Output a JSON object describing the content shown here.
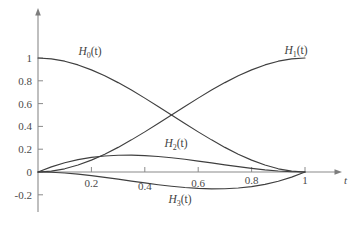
{
  "chart_data": {
    "type": "line",
    "title": "",
    "subtitle": "",
    "xlabel": "t",
    "ylabel": "",
    "xlim": [
      0,
      1.12
    ],
    "ylim": [
      -0.3,
      1.12
    ],
    "grid": false,
    "legend_position": "inline-labels",
    "x_ticks": [
      {
        "value": 0.2,
        "label": "0.2"
      },
      {
        "value": 0.4,
        "label": "0.4"
      },
      {
        "value": 0.6,
        "label": "0.6"
      },
      {
        "value": 0.8,
        "label": "0.8"
      },
      {
        "value": 1.0,
        "label": "1"
      }
    ],
    "y_ticks": [
      {
        "value": 1.0,
        "label": "1"
      },
      {
        "value": 0.8,
        "label": "0.8"
      },
      {
        "value": 0.6,
        "label": "0.6"
      },
      {
        "value": 0.4,
        "label": "0.4"
      },
      {
        "value": 0.2,
        "label": "0.2"
      },
      {
        "value": 0.0,
        "label": "0"
      },
      {
        "value": -0.2,
        "label": "-0.2"
      }
    ],
    "x": [
      0,
      0.05,
      0.1,
      0.15,
      0.2,
      0.25,
      0.3,
      0.35,
      0.4,
      0.45,
      0.5,
      0.55,
      0.6,
      0.65,
      0.7,
      0.75,
      0.8,
      0.85,
      0.9,
      0.95,
      1
    ],
    "series": [
      {
        "name": "H_0(t)",
        "label_base": "H",
        "label_sub": "0",
        "label_tail": "(t)",
        "formula": "2t^3 - 3t^2 + 1",
        "color": "#3f3f3f",
        "values": [
          1,
          0.9928,
          0.972,
          0.9393,
          0.896,
          0.8438,
          0.784,
          0.7183,
          0.648,
          0.5748,
          0.5,
          0.4253,
          0.352,
          0.2818,
          0.216,
          0.1563,
          0.104,
          0.0608,
          0.028,
          0.0073,
          0
        ]
      },
      {
        "name": "H_1(t)",
        "label_base": "H",
        "label_sub": "1",
        "label_tail": "(t)",
        "formula": "-2t^3 + 3t^2",
        "color": "#3f3f3f",
        "values": [
          0,
          0.0073,
          0.028,
          0.0608,
          0.104,
          0.1563,
          0.216,
          0.2818,
          0.352,
          0.4253,
          0.5,
          0.5748,
          0.648,
          0.7183,
          0.784,
          0.8438,
          0.896,
          0.9393,
          0.972,
          0.9928,
          1
        ]
      },
      {
        "name": "H_2(t)",
        "label_base": "H",
        "label_sub": "2",
        "label_tail": "(t)",
        "formula": "t^3 - 2t^2 + t",
        "color": "#3f3f3f",
        "values": [
          0,
          0.0451,
          0.081,
          0.1084,
          0.128,
          0.1406,
          0.147,
          0.1479,
          0.144,
          0.1361,
          0.125,
          0.1114,
          0.096,
          0.0796,
          0.063,
          0.0469,
          0.032,
          0.0191,
          0.009,
          0.0024,
          0
        ]
      },
      {
        "name": "H_3(t)",
        "label_base": "H",
        "label_sub": "3",
        "label_tail": "(t)",
        "formula": "t^3 - t^2",
        "color": "#3f3f3f",
        "values": [
          0,
          -0.0024,
          -0.009,
          -0.0191,
          -0.032,
          -0.0469,
          -0.063,
          -0.0796,
          -0.096,
          -0.1114,
          -0.125,
          -0.1361,
          -0.144,
          -0.1479,
          -0.147,
          -0.1406,
          -0.128,
          -0.1084,
          -0.081,
          -0.0451,
          0
        ]
      }
    ],
    "annotations": [
      {
        "name": "label-h0",
        "text": "H0(t)",
        "x": 0.24,
        "y": 1.08
      },
      {
        "name": "label-h1",
        "text": "H1(t)",
        "x": 0.96,
        "y": 1.08
      },
      {
        "name": "label-h2",
        "text": "H2(t)",
        "x": 0.51,
        "y": 0.32
      },
      {
        "name": "label-h3",
        "text": "H3(t)",
        "x": 0.52,
        "y": -0.23
      }
    ]
  },
  "axes": {
    "x_axis_name": "t",
    "y_axis_name": ""
  },
  "colors": {
    "curve": "#3f3f3f",
    "axis": "#8a8a8a",
    "text": "#4a4a4a",
    "background": "#ffffff"
  }
}
